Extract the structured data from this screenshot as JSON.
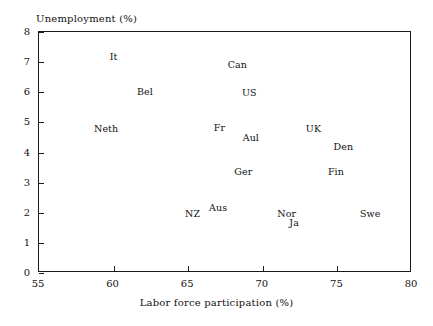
{
  "chart_data": {
    "type": "scatter",
    "title": "",
    "xlabel": "Labor force participation (%)",
    "ylabel": "Unemployment (%)",
    "xlim": [
      55,
      80
    ],
    "ylim": [
      0,
      8
    ],
    "xticks": [
      "55",
      "60",
      "65",
      "70",
      "75",
      "80"
    ],
    "xtick_values": [
      55,
      60,
      65,
      70,
      75,
      80
    ],
    "yticks": [
      "0",
      "1",
      "2",
      "3",
      "4",
      "5",
      "6",
      "7",
      "8"
    ],
    "ytick_values": [
      0,
      1,
      2,
      3,
      4,
      5,
      6,
      7,
      8
    ],
    "grid": false,
    "legend": "none",
    "marker": "text-label",
    "points": [
      {
        "label": "It",
        "x": 60.0,
        "y": 7.2
      },
      {
        "label": "Can",
        "x": 68.3,
        "y": 6.95
      },
      {
        "label": "Bel",
        "x": 62.1,
        "y": 6.05
      },
      {
        "label": "US",
        "x": 69.1,
        "y": 6.0
      },
      {
        "label": "Neth",
        "x": 59.5,
        "y": 4.8
      },
      {
        "label": "Fr",
        "x": 67.1,
        "y": 4.85
      },
      {
        "label": "UK",
        "x": 73.4,
        "y": 4.8
      },
      {
        "label": "Aul",
        "x": 69.2,
        "y": 4.5
      },
      {
        "label": "Den",
        "x": 75.4,
        "y": 4.2
      },
      {
        "label": "Ger",
        "x": 68.7,
        "y": 3.4
      },
      {
        "label": "Fin",
        "x": 74.9,
        "y": 3.4
      },
      {
        "label": "Aus",
        "x": 67.0,
        "y": 2.2
      },
      {
        "label": "NZ",
        "x": 65.3,
        "y": 2.0
      },
      {
        "label": "Nor",
        "x": 71.6,
        "y": 2.0
      },
      {
        "label": "Swe",
        "x": 77.2,
        "y": 2.0
      },
      {
        "label": "Ja",
        "x": 72.1,
        "y": 1.7
      }
    ],
    "colors": {
      "axis": "#1a1a1a",
      "text": "#111111",
      "background": "#ffffff"
    }
  }
}
